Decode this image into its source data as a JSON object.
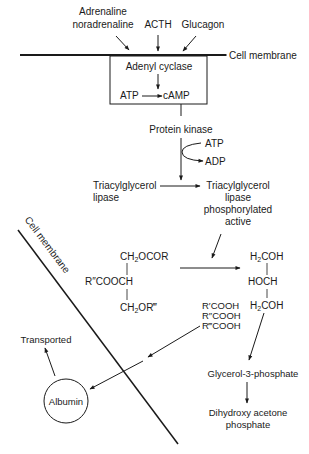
{
  "hormones": {
    "adrenaline_line1": "Adrenaline",
    "adrenaline_line2": "noradrenaline",
    "acth": "ACTH",
    "glucagon": "Glucagon"
  },
  "membrane_top_label": "Cell membrane",
  "box": {
    "enzyme": "Adenyl cyclase",
    "atp": "ATP",
    "camp": "cAMP"
  },
  "protein_kinase": "Protein kinase",
  "pk_atp": "ATP",
  "pk_adp": "ADP",
  "lipase_inactive": {
    "line1": "Triacylglycerol",
    "line2": "lipase"
  },
  "lipase_active": {
    "line1": "Triacylglycerol",
    "line2": "lipase",
    "line3": "phosphorylated",
    "line4": "active"
  },
  "triglyceride": {
    "top": "CH",
    "top_sub": "2",
    "top_rest": "OCOR",
    "middle": "R″COOCH",
    "bottom": "CH",
    "bottom_sub": "2",
    "bottom_rest": "OR‴"
  },
  "glycerol": {
    "top_a": "H",
    "top_sub": "2",
    "top_b": "COH",
    "middle": "HOCH",
    "bottom_a": "H",
    "bottom_sub": "2",
    "bottom_b": "COH"
  },
  "fatty_acids": [
    "R′COOH",
    "R″COOH",
    "R‴COOH"
  ],
  "membrane_diag_label": "Cell membrane",
  "transported": "Transported",
  "albumin": "Albumin",
  "g3p": "Glycerol-3-phosphate",
  "dhap": {
    "line1": "Dihydroxy acetone",
    "line2": "phosphate"
  }
}
